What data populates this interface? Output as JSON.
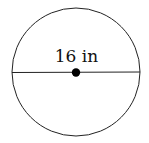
{
  "diagram": {
    "shape": "circle",
    "measurement_label": "16 in",
    "segment": "diameter",
    "stroke_color": "#222222",
    "center_dot_color": "#000000"
  }
}
